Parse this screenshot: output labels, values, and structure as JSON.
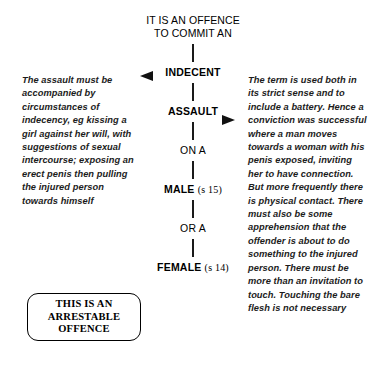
{
  "diagram": {
    "title": "IT IS AN OFFENCE\nTO COMMIT AN",
    "nodes": {
      "indecent": "INDECENT",
      "assault": "ASSAULT",
      "on_a": "ON A",
      "male": "MALE",
      "male_section": "(s 15)",
      "or_a": "OR A",
      "female": "FEMALE",
      "female_section": "(s 14)"
    },
    "markers": {
      "left_pointer": "left-triangle-marker",
      "right_pointer": "right-triangle-marker"
    },
    "annotations": {
      "left": "The assault must be accompanied by circumstances of indecency, eg kissing a girl against her will, with suggestions of sexual intercourse; exposing an erect penis then pulling the injured person towards himself",
      "right": "The term is used both in its strict sense and to include a battery. Hence a conviction was successful where a man moves towards a woman with his penis exposed, inviting her to have connection. But more frequently there is physical contact. There must also be some apprehension that the offender is about to do something to the injured person. There must be more than an invitation to touch. Touching the bare flesh is not necessary"
    },
    "callout": {
      "text": "THIS IS AN\nARRESTABLE\nOFFENCE"
    },
    "colors": {
      "ink": "#000000",
      "connector": "#1a1a1a",
      "background": "#ffffff"
    }
  }
}
